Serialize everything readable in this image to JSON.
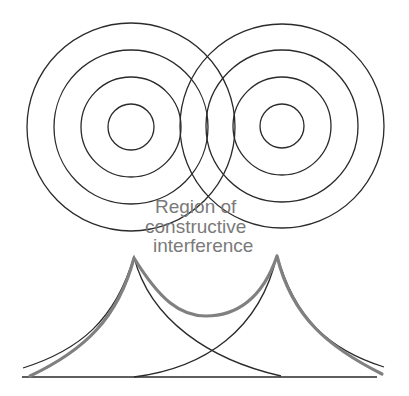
{
  "figure": {
    "width": 409,
    "height": 396,
    "background": "#ffffff",
    "line_color": "#2a2a2a",
    "sum_curve_color": "#808080",
    "label_color": "#7a7a7a"
  },
  "wave_sources": [
    {
      "name": "left-source",
      "cx": 131,
      "cy": 127,
      "radii": [
        23,
        50,
        77,
        104
      ]
    },
    {
      "name": "right-source",
      "cx": 282,
      "cy": 126,
      "radii": [
        22,
        49,
        76,
        102
      ]
    }
  ],
  "label": {
    "lines": [
      "Region  of",
      "constructive",
      "interference"
    ],
    "positions": [
      {
        "x": 155,
        "y": 213
      },
      {
        "x": 145,
        "y": 233
      },
      {
        "x": 153,
        "y": 252
      }
    ]
  },
  "intensity_plot": {
    "baseline": {
      "x1": 22,
      "y": 377,
      "x2": 377
    },
    "left_peak": {
      "x": 134,
      "y": 257
    },
    "right_peak": {
      "x": 277,
      "y": 255
    },
    "individual_curves": [
      "M 23 368 C 80 350, 115 320, 134 257 C 150 320, 210 360, 281 376",
      "M 134 377 C 205 368, 260 330, 277 255 C 295 320, 330 350, 384 367"
    ],
    "sum_curve": "M 30 376 C 85 350, 118 318, 134 258 C 160 300, 180 316, 206 316 C 235 316, 262 300, 277 256 C 292 318, 330 348, 382 374"
  }
}
